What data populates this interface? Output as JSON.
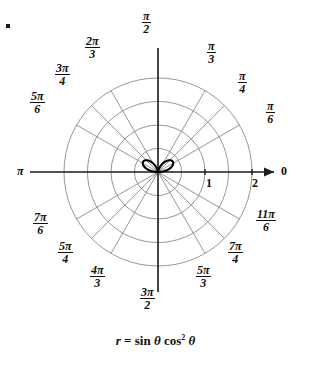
{
  "figure": {
    "title": "",
    "equation_parts": {
      "r": "r",
      "equals": "=",
      "sin": "sin",
      "theta1": "θ",
      "cos": "cos",
      "exponent": "2",
      "theta2": "θ"
    },
    "equation_text": "r = sin θ cos² θ",
    "polar_axis_zero_label": "0",
    "pi_label": "π",
    "radial_ticks": [
      "1",
      "2"
    ],
    "angle_labels": [
      {
        "name": "pi-over-2",
        "num": "π",
        "den": "2",
        "angle_deg": 90,
        "x": 142,
        "y": 10
      },
      {
        "name": "2pi-over-3",
        "num": "2π",
        "den": "3",
        "angle_deg": 120,
        "x": 85,
        "y": 35
      },
      {
        "name": "3pi-over-4",
        "num": "3π",
        "den": "4",
        "angle_deg": 135,
        "x": 55,
        "y": 62
      },
      {
        "name": "5pi-over-6",
        "num": "5π",
        "den": "6",
        "angle_deg": 150,
        "x": 30,
        "y": 90
      },
      {
        "name": "pi",
        "num": "",
        "den": "",
        "angle_deg": 180,
        "x": 18,
        "y": 164
      },
      {
        "name": "7pi-over-6",
        "num": "7π",
        "den": "6",
        "angle_deg": 210,
        "x": 33,
        "y": 211
      },
      {
        "name": "5pi-over-4",
        "num": "5π",
        "den": "4",
        "angle_deg": 225,
        "x": 58,
        "y": 240
      },
      {
        "name": "4pi-over-3",
        "num": "4π",
        "den": "3",
        "angle_deg": 240,
        "x": 90,
        "y": 264
      },
      {
        "name": "3pi-over-2",
        "num": "3π",
        "den": "2",
        "angle_deg": 270,
        "x": 140,
        "y": 286
      },
      {
        "name": "5pi-over-3",
        "num": "5π",
        "den": "3",
        "angle_deg": 300,
        "x": 196,
        "y": 264
      },
      {
        "name": "7pi-over-4",
        "num": "7π",
        "den": "4",
        "angle_deg": 315,
        "x": 228,
        "y": 240
      },
      {
        "name": "11pi-over-6",
        "num": "11π",
        "den": "6",
        "angle_deg": 330,
        "x": 256,
        "y": 208
      },
      {
        "name": "pi-over-6",
        "num": "π",
        "den": "6",
        "angle_deg": 30,
        "x": 266,
        "y": 100
      },
      {
        "name": "pi-over-4",
        "num": "π",
        "den": "4",
        "angle_deg": 45,
        "x": 238,
        "y": 70
      },
      {
        "name": "pi-over-3",
        "num": "π",
        "den": "3",
        "angle_deg": 60,
        "x": 207,
        "y": 40
      }
    ]
  },
  "chart_data": {
    "type": "line",
    "coordinate_system": "polar",
    "title": "",
    "equation": "r = sin θ cos^2 θ",
    "xlabel": "",
    "ylabel": "",
    "grid": true,
    "legend": null,
    "r_range": [
      0,
      2
    ],
    "r_gridlines": [
      0.5,
      1.0,
      1.5,
      2.0
    ],
    "r_tick_labels": [
      "1",
      "2"
    ],
    "r_tick_values": [
      1,
      2
    ],
    "theta_gridlines_deg": [
      0,
      30,
      45,
      60,
      90,
      120,
      135,
      150,
      180,
      210,
      225,
      240,
      270,
      300,
      315,
      330
    ],
    "theta_tick_labels": [
      "0",
      "π/6",
      "π/4",
      "π/3",
      "π/2",
      "2π/3",
      "3π/4",
      "5π/6",
      "π",
      "7π/6",
      "5π/4",
      "4π/3",
      "3π/2",
      "5π/3",
      "7π/4",
      "11π/6"
    ],
    "curve": {
      "name": "r = sin(theta) cos^2(theta)",
      "max_r": 0.385,
      "max_r_at_theta_deg": [
        35.26,
        144.74
      ],
      "points_theta_deg": [
        0,
        10,
        20,
        30,
        35.26,
        40,
        50,
        60,
        70,
        80,
        90,
        100,
        110,
        120,
        130,
        140,
        144.74,
        150,
        160,
        170,
        180
      ],
      "points_r": [
        0.0,
        0.168,
        0.302,
        0.375,
        0.385,
        0.377,
        0.317,
        0.217,
        0.11,
        0.03,
        0.0,
        0.03,
        0.11,
        0.217,
        0.317,
        0.377,
        0.385,
        0.375,
        0.302,
        0.168,
        0.0
      ]
    },
    "colors": {
      "grid": "#8a8a8a",
      "axis": "#1a1a1a",
      "curve": "#000000",
      "background": "#ffffff",
      "text": "#111111"
    }
  }
}
